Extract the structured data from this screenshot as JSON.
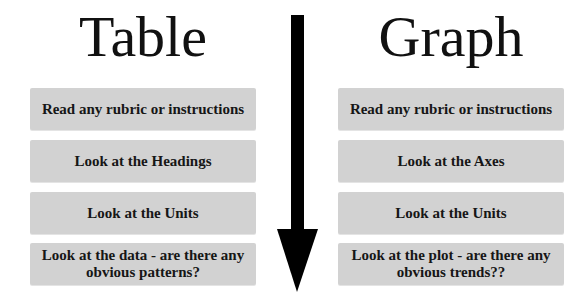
{
  "left_column": {
    "title": "Table",
    "steps": [
      {
        "label": "Read any rubric or instructions"
      },
      {
        "label": "Look at the Headings"
      },
      {
        "label": "Look at the Units"
      },
      {
        "label": "Look at the data - are there any obvious patterns?"
      }
    ]
  },
  "right_column": {
    "title": "Graph",
    "steps": [
      {
        "label": "Read any rubric or instructions"
      },
      {
        "label": "Look at the Axes"
      },
      {
        "label": "Look at the Units"
      },
      {
        "label": "Look at the plot - are there any obvious trends??"
      }
    ]
  },
  "arrow": {
    "icon": "down-arrow-icon",
    "direction": "down",
    "color": "#000000"
  },
  "colors": {
    "background": "#ffffff",
    "box_fill": "#d2d2d2",
    "text": "#111111"
  }
}
